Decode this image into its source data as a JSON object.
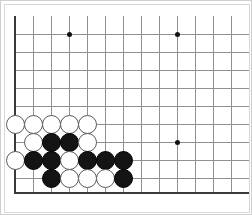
{
  "diagram": {
    "kind": "go-board-diagram",
    "board": {
      "grid_origin_x": 15,
      "grid_origin_y": 16,
      "grid_spacing": 18,
      "columns_visible": 13,
      "rows_visible": 10,
      "line_color": "#909090",
      "edge_color": "#3a3a3a",
      "background_color": "#ffffff",
      "left_edge_x": 15,
      "bottom_edge_y": 192,
      "top_line_y": 34,
      "cropped_edges": [
        "top",
        "right"
      ]
    },
    "frame": {
      "outer_border_color": "#cfcfcf",
      "inner_border_color": "#d8d8d8"
    },
    "star_points": [
      {
        "x": 69,
        "y": 34
      },
      {
        "x": 177,
        "y": 34
      },
      {
        "x": 177,
        "y": 142
      }
    ],
    "stone_colors": {
      "black": "#141414",
      "white": "#ffffff",
      "white_outline": "#5a5a5a"
    },
    "stones": [
      {
        "color": "white",
        "x": 15,
        "y": 124
      },
      {
        "color": "white",
        "x": 33,
        "y": 124
      },
      {
        "color": "white",
        "x": 51,
        "y": 124
      },
      {
        "color": "white",
        "x": 69,
        "y": 124
      },
      {
        "color": "white",
        "x": 87,
        "y": 124
      },
      {
        "color": "white",
        "x": 33,
        "y": 142
      },
      {
        "color": "black",
        "x": 51,
        "y": 142
      },
      {
        "color": "black",
        "x": 69,
        "y": 142
      },
      {
        "color": "white",
        "x": 87,
        "y": 142
      },
      {
        "color": "white",
        "x": 15,
        "y": 160
      },
      {
        "color": "black",
        "x": 33,
        "y": 160
      },
      {
        "color": "black",
        "x": 51,
        "y": 160
      },
      {
        "color": "white",
        "x": 69,
        "y": 160
      },
      {
        "color": "black",
        "x": 87,
        "y": 160
      },
      {
        "color": "black",
        "x": 105,
        "y": 160
      },
      {
        "color": "black",
        "x": 123,
        "y": 160
      },
      {
        "color": "black",
        "x": 51,
        "y": 178
      },
      {
        "color": "white",
        "x": 69,
        "y": 178
      },
      {
        "color": "white",
        "x": 87,
        "y": 178
      },
      {
        "color": "white",
        "x": 105,
        "y": 178
      },
      {
        "color": "black",
        "x": 123,
        "y": 178
      }
    ],
    "counts": {
      "black_stones": 10,
      "white_stones": 11,
      "total_stones": 21
    }
  }
}
